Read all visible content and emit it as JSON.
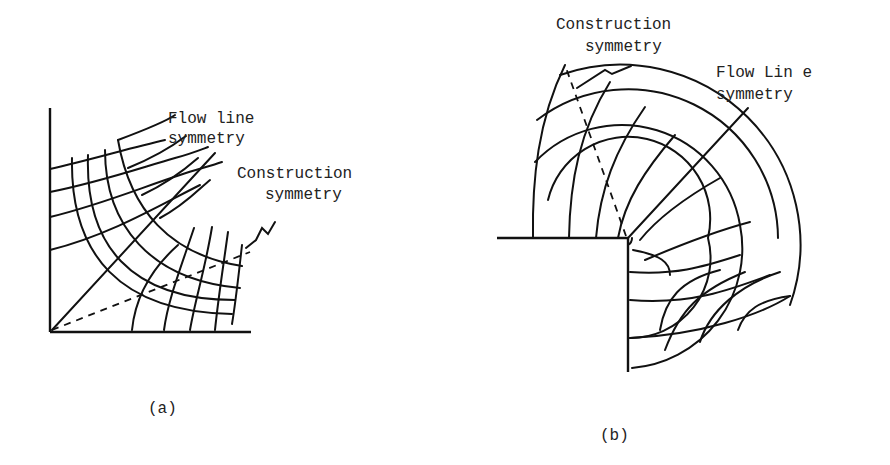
{
  "figure": {
    "panel_a": {
      "caption": "(a)",
      "labels": {
        "flow_line_1": "Flow line",
        "flow_line_2": "symmetry",
        "construction_1": "Construction",
        "construction_2": "symmetry"
      }
    },
    "panel_b": {
      "caption": "(b)",
      "labels": {
        "construction_1": "Construction",
        "construction_2": "symmetry",
        "flow_line_1": "Flow Lin e",
        "flow_line_2": "symmetry"
      }
    }
  }
}
